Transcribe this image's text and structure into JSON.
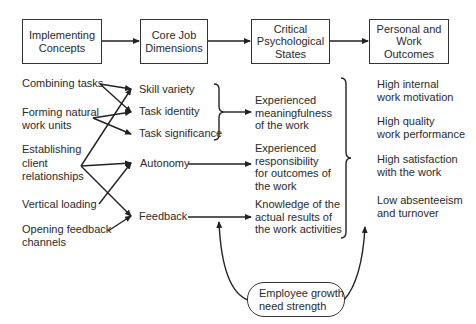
{
  "headers": [
    {
      "id": "implementing",
      "lines": [
        "Implementing",
        "Concepts"
      ]
    },
    {
      "id": "core",
      "lines": [
        "Core Job",
        "Dimensions"
      ]
    },
    {
      "id": "critical",
      "lines": [
        "Critical",
        "Psychological",
        "States"
      ]
    },
    {
      "id": "outcomes_header",
      "lines": [
        "Personal and",
        "Work Outcomes"
      ]
    }
  ],
  "implementing_concepts": [
    {
      "lines": [
        "Combining tasks"
      ]
    },
    {
      "lines": [
        "Forming natural",
        "work units"
      ]
    },
    {
      "lines": [
        "Establishing",
        "client",
        "relationships"
      ]
    },
    {
      "lines": [
        "Vertical loading"
      ]
    },
    {
      "lines": [
        "Opening feedback",
        "channels"
      ]
    }
  ],
  "core_dimensions": [
    {
      "label": "Skill variety"
    },
    {
      "label": "Task identity"
    },
    {
      "label": "Task significance"
    },
    {
      "label": "Autonomy"
    },
    {
      "label": "Feedback"
    }
  ],
  "critical_states": [
    {
      "lines": [
        "Experienced",
        "meaningfulness",
        "of the work"
      ]
    },
    {
      "lines": [
        "Experienced",
        "responsibility",
        "for outcomes of",
        "the work"
      ]
    },
    {
      "lines": [
        "Knowledge of the",
        "actual results of",
        "the work activities"
      ]
    }
  ],
  "outcomes": [
    {
      "lines": [
        "High internal",
        "work motivation"
      ]
    },
    {
      "lines": [
        "High quality",
        "work performance"
      ]
    },
    {
      "lines": [
        "High satisfaction",
        "with the work"
      ]
    },
    {
      "lines": [
        "Low absenteeism",
        "and turnover"
      ]
    }
  ],
  "moderator": {
    "lines": [
      "Employee growth",
      "need strength"
    ]
  },
  "colors": {
    "line": "#222222",
    "text": "#2a2a2a",
    "background": "#ffffff"
  }
}
